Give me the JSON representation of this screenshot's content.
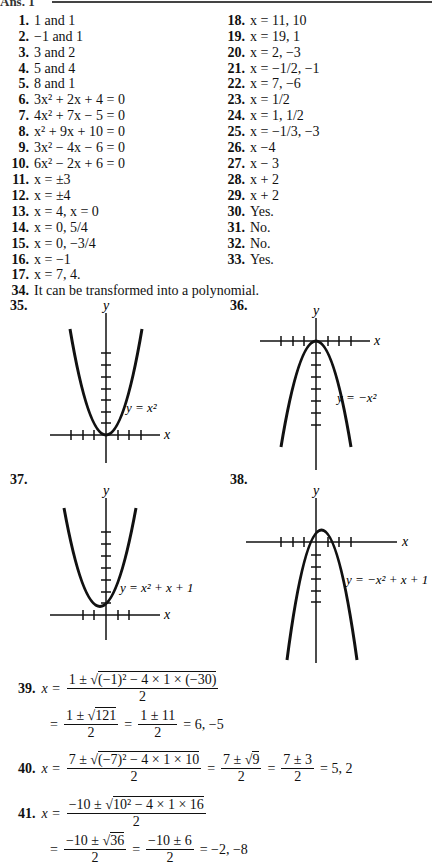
{
  "header": {
    "cut_text": "Ans. 1"
  },
  "answers_col1": [
    {
      "num": "1.",
      "text": "1 and 1"
    },
    {
      "num": "2.",
      "text": "−1 and 1"
    },
    {
      "num": "3.",
      "text": "3 and 2"
    },
    {
      "num": "4.",
      "text": "5 and 4"
    },
    {
      "num": "5.",
      "text": "8 and 1"
    },
    {
      "num": "6.",
      "text": "3x² + 2x + 4 = 0"
    },
    {
      "num": "7.",
      "text": "4x² + 7x − 5 = 0"
    },
    {
      "num": "8.",
      "text": "x² + 9x + 10 = 0"
    },
    {
      "num": "9.",
      "text": "3x² − 4x − 6 = 0"
    },
    {
      "num": "10.",
      "text": "6x² − 2x + 6 = 0"
    },
    {
      "num": "11.",
      "text": "x =  ±3"
    },
    {
      "num": "12.",
      "text": "x =  ±4"
    },
    {
      "num": "13.",
      "text": "x = 4, x = 0"
    },
    {
      "num": "14.",
      "text": "x = 0, 5/4"
    },
    {
      "num": "15.",
      "text": "x = 0, −3/4"
    },
    {
      "num": "16.",
      "text": "x =  −1"
    },
    {
      "num": "17.",
      "text": "x = 7, 4."
    }
  ],
  "answers_col2": [
    {
      "num": "18.",
      "text": "x = 11, 10"
    },
    {
      "num": "19.",
      "text": "x = 19, 1"
    },
    {
      "num": "20.",
      "text": "x = 2, −3"
    },
    {
      "num": "21.",
      "text": "x =  −1/2, −1"
    },
    {
      "num": "22.",
      "text": "x = 7, −6"
    },
    {
      "num": "23.",
      "text": "x = 1/2"
    },
    {
      "num": "24.",
      "text": "x = 1, 1/2"
    },
    {
      "num": "25.",
      "text": "x =  −1/3, −3"
    },
    {
      "num": "26.",
      "text": "x −4"
    },
    {
      "num": "27.",
      "text": "x − 3"
    },
    {
      "num": "28.",
      "text": "x + 2"
    },
    {
      "num": "29.",
      "text": "x + 2"
    },
    {
      "num": "30.",
      "text": "Yes."
    },
    {
      "num": "31.",
      "text": "No."
    },
    {
      "num": "32.",
      "text": "No."
    },
    {
      "num": "33.",
      "text": "Yes."
    }
  ],
  "answer_34": {
    "num": "34.",
    "text": "It can be transformed into a polynomial."
  },
  "graphs": [
    {
      "num": "35.",
      "axis_x": "x",
      "axis_y": "y",
      "equation": "y = x²"
    },
    {
      "num": "36.",
      "axis_x": "x",
      "axis_y": "y",
      "equation": "y = −x²"
    },
    {
      "num": "37.",
      "axis_x": "x",
      "axis_y": "y",
      "equation": "y = x² + x + 1"
    },
    {
      "num": "38.",
      "axis_x": "x",
      "axis_y": "y",
      "equation": "y = −x² + x + 1"
    }
  ],
  "problem_39": {
    "num": "39.",
    "lhs": "x =",
    "num1": "1 ±",
    "rad1": "(−1)² − 4 × 1 × (−30)",
    "den": "2",
    "eq": "=",
    "num2": "1 ±",
    "rad2": "121",
    "num3": "1 ± 11",
    "result": "= 6, −5"
  },
  "problem_40": {
    "num": "40.",
    "lhs": "x =",
    "num1": "7 ±",
    "rad1": "(−7)² − 4 × 1 × 10",
    "den": "2",
    "eq": "=",
    "num2": "7 ±",
    "rad2": "9",
    "num3": "7 ± 3",
    "result": "= 5, 2"
  },
  "problem_41": {
    "num": "41.",
    "lhs": "x =",
    "num1": "−10 ±",
    "rad1": "10² − 4 × 1 × 16",
    "den": "2",
    "eq": "=",
    "num2": "−10 ±",
    "rad2": "36",
    "num3": "−10 ± 6",
    "result": "= −2, −8"
  }
}
